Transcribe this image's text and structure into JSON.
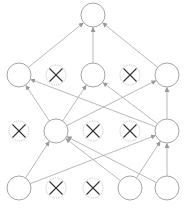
{
  "diagram": {
    "colors": {
      "background": "#ffffff",
      "node_stroke": "#9a9a9a",
      "dropped_stroke": "#b0b0b0",
      "cross": "#333333",
      "edge": "#a8a8a8"
    },
    "node_radius": 12,
    "layers": [
      {
        "name": "output",
        "y": 15,
        "nodes": [
          {
            "x": 93,
            "dropped": false
          }
        ]
      },
      {
        "name": "hidden-2",
        "y": 75,
        "nodes": [
          {
            "x": 19,
            "dropped": false
          },
          {
            "x": 56,
            "dropped": true
          },
          {
            "x": 93,
            "dropped": false
          },
          {
            "x": 130,
            "dropped": true
          },
          {
            "x": 167,
            "dropped": false
          }
        ]
      },
      {
        "name": "hidden-1",
        "y": 131,
        "nodes": [
          {
            "x": 19,
            "dropped": true
          },
          {
            "x": 56,
            "dropped": false
          },
          {
            "x": 93,
            "dropped": true
          },
          {
            "x": 130,
            "dropped": true
          },
          {
            "x": 167,
            "dropped": false
          }
        ]
      },
      {
        "name": "input",
        "y": 188,
        "nodes": [
          {
            "x": 19,
            "dropped": false
          },
          {
            "x": 56,
            "dropped": true
          },
          {
            "x": 93,
            "dropped": true
          },
          {
            "x": 130,
            "dropped": false
          },
          {
            "x": 167,
            "dropped": false
          }
        ]
      }
    ],
    "edges": [
      {
        "from": [
          1,
          0
        ],
        "to": [
          0,
          0
        ]
      },
      {
        "from": [
          1,
          2
        ],
        "to": [
          0,
          0
        ]
      },
      {
        "from": [
          1,
          4
        ],
        "to": [
          0,
          0
        ]
      },
      {
        "from": [
          2,
          1
        ],
        "to": [
          1,
          0
        ]
      },
      {
        "from": [
          2,
          1
        ],
        "to": [
          1,
          2
        ]
      },
      {
        "from": [
          2,
          1
        ],
        "to": [
          1,
          4
        ]
      },
      {
        "from": [
          2,
          4
        ],
        "to": [
          1,
          0
        ]
      },
      {
        "from": [
          2,
          4
        ],
        "to": [
          1,
          2
        ]
      },
      {
        "from": [
          2,
          4
        ],
        "to": [
          1,
          4
        ]
      },
      {
        "from": [
          3,
          0
        ],
        "to": [
          2,
          1
        ]
      },
      {
        "from": [
          3,
          0
        ],
        "to": [
          2,
          4
        ]
      },
      {
        "from": [
          3,
          3
        ],
        "to": [
          2,
          1
        ]
      },
      {
        "from": [
          3,
          3
        ],
        "to": [
          2,
          4
        ]
      },
      {
        "from": [
          3,
          4
        ],
        "to": [
          2,
          1
        ]
      },
      {
        "from": [
          3,
          4
        ],
        "to": [
          2,
          4
        ]
      }
    ]
  }
}
